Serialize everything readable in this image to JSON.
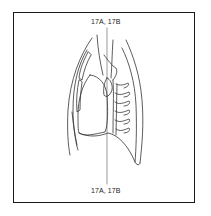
{
  "figure": {
    "section_line": {
      "top_label": "17A, 17B",
      "bottom_label": "17A, 17B"
    },
    "colors": {
      "line": "#333333",
      "frame": "#1a1a1a",
      "background": "#ffffff"
    }
  }
}
